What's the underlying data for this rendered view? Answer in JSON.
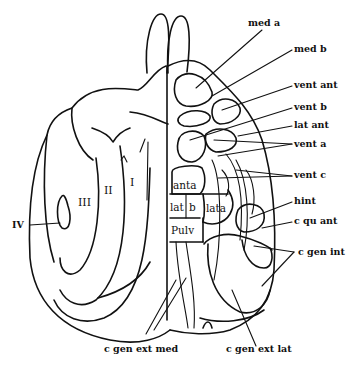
{
  "diagram": {
    "right_labels": {
      "med_a": "med a",
      "med_b": "med  b",
      "vent_ant": "vent ant",
      "vent_b": "vent b",
      "lat_ant": "lat ant",
      "vent_a": "vent a",
      "vent_c": "vent c",
      "hint": "hint",
      "c_qu_ant": "c qu ant",
      "c_gen_int": "c gen int"
    },
    "bottom_labels": {
      "c_gen_ext_med": "c gen ext med",
      "c_gen_ext_lat": "c gen ext lat"
    },
    "left_labels": {
      "IV": "IV"
    },
    "zone_labels": {
      "I": "I",
      "II": "II",
      "III": "III"
    },
    "inner_labels": {
      "anta": "anta",
      "lat": "lat",
      "b": "b",
      "lata": "lata",
      "pulv": "Pulv"
    }
  }
}
